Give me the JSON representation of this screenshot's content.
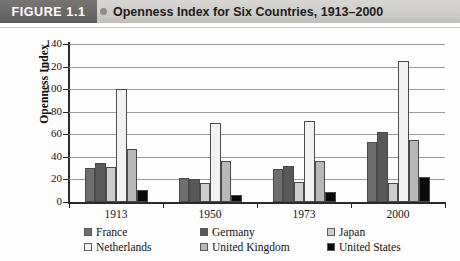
{
  "header": {
    "figure_tag": "FIGURE 1.1",
    "title": "Openness Index for Six Countries, 1913–2000"
  },
  "axes": {
    "y_axis_title": "Openness Index",
    "y_ticks": [
      "140",
      "120",
      "100",
      "80",
      "60",
      "40",
      "20",
      "0"
    ],
    "x_ticks": [
      "1913",
      "1950",
      "1973",
      "2000"
    ]
  },
  "legend": {
    "items": [
      {
        "label": "France",
        "color": "#6e6e6e"
      },
      {
        "label": "Germany",
        "color": "#585858"
      },
      {
        "label": "Japan",
        "color": "#cdcdcd"
      },
      {
        "label": "Netherlands",
        "color": "#f2f2f2"
      },
      {
        "label": "United Kingdom",
        "color": "#b8b8b8"
      },
      {
        "label": "United States",
        "color": "#0a0a0a"
      }
    ]
  },
  "chart_data": {
    "type": "bar",
    "title": "Openness Index for Six Countries, 1913–2000",
    "xlabel": "",
    "ylabel": "Openness Index",
    "ylim": [
      0,
      140
    ],
    "ytick_step": 20,
    "grid": true,
    "legend_position": "bottom",
    "categories": [
      "1913",
      "1950",
      "1973",
      "2000"
    ],
    "series": [
      {
        "name": "France",
        "color": "#6e6e6e",
        "values": [
          30,
          21,
          29,
          53
        ]
      },
      {
        "name": "Germany",
        "color": "#585858",
        "values": [
          35,
          20,
          32,
          62
        ]
      },
      {
        "name": "Japan",
        "color": "#cdcdcd",
        "values": [
          31,
          17,
          18,
          17
        ]
      },
      {
        "name": "Netherlands",
        "color": "#f2f2f2",
        "values": [
          100,
          70,
          72,
          125
        ]
      },
      {
        "name": "United Kingdom",
        "color": "#b8b8b8",
        "values": [
          47,
          36,
          36,
          55
        ]
      },
      {
        "name": "United States",
        "color": "#0a0a0a",
        "values": [
          11,
          6,
          9,
          22
        ]
      }
    ]
  }
}
